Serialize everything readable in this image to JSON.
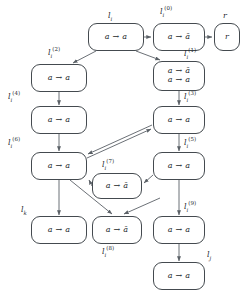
{
  "diagram": {
    "type": "flow-graph",
    "title": "",
    "nodes": [
      {
        "id": "li",
        "label_main": "l",
        "label_sub": "i",
        "label_sup": "",
        "lines": [
          "a → a"
        ],
        "x": 88,
        "y": 23,
        "w": 56,
        "h": 28
      },
      {
        "id": "li0",
        "label_main": "l",
        "label_sub": "i",
        "label_sup": "(0)",
        "lines": [
          "a → ā"
        ],
        "x": 153,
        "y": 23,
        "w": 52,
        "h": 28
      },
      {
        "id": "r",
        "label_main": "r",
        "label_sub": "",
        "label_sup": "",
        "lines": [
          "r"
        ],
        "x": 214,
        "y": 23,
        "w": 26,
        "h": 28
      },
      {
        "id": "li2",
        "label_main": "l",
        "label_sub": "i",
        "label_sup": "(2)",
        "lines": [
          "a → a"
        ],
        "x": 31,
        "y": 64,
        "w": 56,
        "h": 28
      },
      {
        "id": "li1",
        "label_main": "l",
        "label_sub": "i",
        "label_sup": "(1)",
        "lines": [
          "a → ā",
          "a → a"
        ],
        "x": 153,
        "y": 61,
        "w": 52,
        "h": 30
      },
      {
        "id": "li4",
        "label_main": "l",
        "label_sub": "i",
        "label_sup": "(4)",
        "lines": [
          "a → a"
        ],
        "x": 31,
        "y": 106,
        "w": 56,
        "h": 28
      },
      {
        "id": "li3",
        "label_main": "l",
        "label_sub": "i",
        "label_sup": "(3)",
        "lines": [
          "a → a"
        ],
        "x": 153,
        "y": 106,
        "w": 52,
        "h": 28
      },
      {
        "id": "li6",
        "label_main": "l",
        "label_sub": "i",
        "label_sup": "(6)",
        "lines": [
          "a → a"
        ],
        "x": 31,
        "y": 152,
        "w": 56,
        "h": 28
      },
      {
        "id": "li5",
        "label_main": "l",
        "label_sub": "i",
        "label_sup": "(5)",
        "lines": [
          "a → a"
        ],
        "x": 153,
        "y": 152,
        "w": 52,
        "h": 28
      },
      {
        "id": "li7",
        "label_main": "l",
        "label_sub": "i",
        "label_sup": "(7)",
        "lines": [
          "a → ā"
        ],
        "x": 92,
        "y": 173,
        "w": 50,
        "h": 26
      },
      {
        "id": "lk",
        "label_main": "l",
        "label_sub": "k",
        "label_sup": "",
        "lines": [
          "a → a"
        ],
        "x": 31,
        "y": 216,
        "w": 56,
        "h": 28
      },
      {
        "id": "li8",
        "label_main": "l",
        "label_sub": "i",
        "label_sup": "(8)",
        "lines": [
          "a → ā"
        ],
        "x": 92,
        "y": 216,
        "w": 50,
        "h": 28
      },
      {
        "id": "li9",
        "label_main": "l",
        "label_sub": "i",
        "label_sup": "(9)",
        "lines": [
          "a → a"
        ],
        "x": 153,
        "y": 216,
        "w": 52,
        "h": 28
      },
      {
        "id": "lj",
        "label_main": "l",
        "label_sub": "j",
        "label_sup": "",
        "lines": [
          "a → a"
        ],
        "x": 153,
        "y": 262,
        "w": 52,
        "h": 28
      }
    ],
    "label_positions": [
      {
        "for": "li",
        "x": 108,
        "y": 11,
        "main": "l",
        "sub": "i",
        "sup": ""
      },
      {
        "for": "li0",
        "x": 160,
        "y": 7,
        "main": "l",
        "sub": "i",
        "sup": "(0)"
      },
      {
        "for": "r",
        "x": 223,
        "y": 11,
        "main": "r",
        "sub": "",
        "sup": ""
      },
      {
        "for": "li2",
        "x": 48,
        "y": 48,
        "main": "l",
        "sub": "i",
        "sup": "(2)"
      },
      {
        "for": "li1",
        "x": 184,
        "y": 49,
        "main": "l",
        "sub": "i",
        "sup": "(1)"
      },
      {
        "for": "li4",
        "x": 8,
        "y": 92,
        "main": "l",
        "sub": "i",
        "sup": "(4)"
      },
      {
        "for": "li3",
        "x": 184,
        "y": 92,
        "main": "l",
        "sub": "i",
        "sup": "(3)"
      },
      {
        "for": "li6",
        "x": 8,
        "y": 138,
        "main": "l",
        "sub": "i",
        "sup": "(6)"
      },
      {
        "for": "li5",
        "x": 184,
        "y": 138,
        "main": "l",
        "sub": "i",
        "sup": "(5)"
      },
      {
        "for": "li7",
        "x": 102,
        "y": 160,
        "main": "l",
        "sub": "i",
        "sup": "(7)"
      },
      {
        "for": "lk",
        "x": 21,
        "y": 205,
        "main": "l",
        "sub": "k",
        "sup": ""
      },
      {
        "for": "li8",
        "x": 102,
        "y": 247,
        "main": "l",
        "sub": "i",
        "sup": "(8)"
      },
      {
        "for": "li9",
        "x": 184,
        "y": 202,
        "main": "l",
        "sub": "i",
        "sup": "(9)"
      },
      {
        "for": "lj",
        "x": 207,
        "y": 250,
        "main": "l",
        "sub": "j",
        "sup": ""
      }
    ],
    "edges": [
      {
        "from": "li",
        "to": "li0",
        "kind": "straight"
      },
      {
        "from": "li0",
        "to": "r",
        "kind": "straight"
      },
      {
        "from": "li",
        "to": "li2",
        "kind": "diagonal"
      },
      {
        "from": "li",
        "to": "li1",
        "kind": "diagonal"
      },
      {
        "from": "li2",
        "to": "li4",
        "kind": "straight"
      },
      {
        "from": "li1",
        "to": "li3",
        "kind": "straight"
      },
      {
        "from": "li4",
        "to": "li6",
        "kind": "straight"
      },
      {
        "from": "li3",
        "to": "li5",
        "kind": "straight"
      },
      {
        "from": "li6",
        "to": "li3",
        "kind": "diagonal"
      },
      {
        "from": "li3",
        "to": "li6",
        "kind": "diagonal"
      },
      {
        "from": "li5",
        "to": "li7",
        "kind": "diagonal"
      },
      {
        "from": "li7",
        "to": "li6",
        "kind": "straight"
      },
      {
        "from": "li6",
        "to": "lk",
        "kind": "straight"
      },
      {
        "from": "li6",
        "to": "li8",
        "kind": "diagonal"
      },
      {
        "from": "li9",
        "to": "li8",
        "kind": "diagonal"
      },
      {
        "from": "li5",
        "to": "li9",
        "kind": "straight"
      },
      {
        "from": "li9",
        "to": "lj",
        "kind": "straight"
      }
    ],
    "colors": {
      "node_border": "#444a4f",
      "edge": "#5a6066",
      "text": "#23282c",
      "background": "#ffffff"
    }
  }
}
